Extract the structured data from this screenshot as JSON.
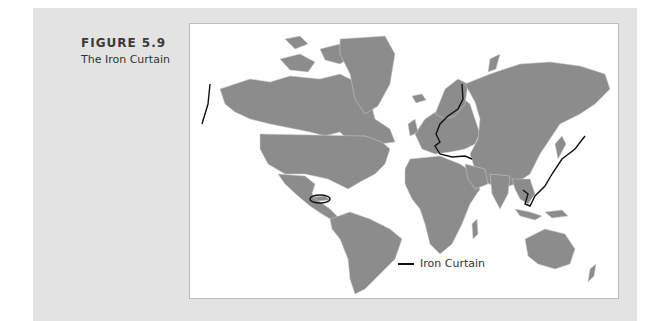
{
  "figure": {
    "number": "FIGURE 5.9",
    "title": "The Iron Curtain"
  },
  "map": {
    "land_color": "#8c8c8c",
    "border_color": "#d0d0d0",
    "line_color": "#111111",
    "features": [
      "Bering Strait line",
      "Cuba ellipse",
      "Europe Iron Curtain line",
      "East Asia line"
    ]
  },
  "legend": {
    "items": [
      {
        "label": "Iron Curtain",
        "color": "#111111",
        "style": "line"
      }
    ]
  }
}
